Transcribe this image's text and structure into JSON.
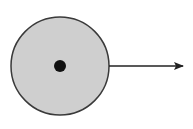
{
  "diagram": {
    "circle": {
      "cx": 60,
      "cy": 66,
      "r": 49,
      "fill": "#cfcfcf",
      "stroke": "#3a3a3a"
    },
    "center_dot": {
      "cx": 60,
      "cy": 66,
      "r": 6,
      "fill": "#111111"
    },
    "arrow": {
      "x1": 109,
      "y1": 66,
      "x2": 183,
      "y2": 66,
      "color": "#222222",
      "direction": "right"
    }
  }
}
